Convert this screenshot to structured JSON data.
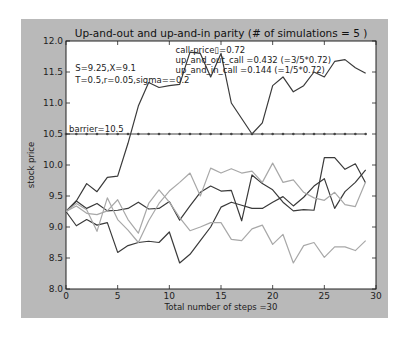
{
  "chart_data": {
    "type": "line",
    "title": "Up-and-out and up-and-in parity (# of simulations = 5 )",
    "xlabel": "Total number of steps =30",
    "ylabel": "stock price",
    "xlim": [
      0,
      30
    ],
    "ylim": [
      8.0,
      12.0
    ],
    "xticks": [
      "0",
      "5",
      "10",
      "15",
      "20",
      "25",
      "30"
    ],
    "yticks": [
      "8.0",
      "8.5",
      "9.0",
      "9.5",
      "10.0",
      "10.5",
      "11.0",
      "11.5",
      "12.0"
    ],
    "grid": false,
    "legend": null,
    "barrier": {
      "value": 10.5,
      "label": "barrier=10.5",
      "style": "dotted-marker line"
    },
    "annotations": {
      "params_line1": "S=9.25,X=9.1",
      "params_line2": "T=0.5,r=0.05,sigma==0.2",
      "call_price": "call-price▯=0.72",
      "up_and_out": "up_and_out_call =0.432 (=3/5*0.72)",
      "up_and_in": "up_and_in_call =0.144 (=1/5*0.72)"
    },
    "x": [
      0,
      1,
      2,
      3,
      4,
      5,
      6,
      7,
      8,
      9,
      10,
      11,
      12,
      13,
      14,
      15,
      16,
      17,
      18,
      19,
      20,
      21,
      22,
      23,
      24,
      25,
      26,
      27,
      28,
      29
    ],
    "series": [
      {
        "name": "path-1",
        "color": "#3a3a3a",
        "values": [
          9.25,
          9.42,
          9.7,
          9.57,
          9.8,
          9.82,
          10.35,
          10.95,
          11.33,
          11.25,
          11.28,
          11.3,
          11.82,
          11.8,
          11.42,
          11.8,
          11.0,
          10.75,
          10.5,
          10.68,
          11.28,
          11.42,
          11.18,
          11.28,
          11.5,
          11.42,
          11.67,
          11.7,
          11.57,
          11.48
        ]
      },
      {
        "name": "path-2",
        "color": "#3a3a3a",
        "values": [
          9.25,
          9.02,
          9.12,
          9.03,
          9.07,
          8.59,
          8.7,
          8.75,
          8.77,
          8.75,
          8.92,
          8.42,
          8.56,
          8.78,
          9.0,
          9.32,
          9.4,
          9.35,
          9.3,
          9.3,
          9.4,
          9.49,
          9.34,
          9.48,
          9.66,
          9.78,
          9.3,
          9.57,
          9.72,
          9.92
        ]
      },
      {
        "name": "path-3",
        "color": "#3a3a3a",
        "values": [
          9.25,
          9.42,
          9.3,
          9.38,
          9.26,
          9.27,
          9.3,
          9.4,
          9.29,
          9.3,
          9.41,
          9.11,
          9.34,
          9.56,
          9.66,
          9.58,
          9.59,
          9.1,
          9.84,
          9.7,
          9.6,
          9.4,
          9.26,
          9.28,
          9.27,
          10.12,
          10.12,
          9.93,
          10.02,
          9.71
        ]
      },
      {
        "name": "path-4",
        "color": "#a8a8a8",
        "values": [
          9.25,
          9.38,
          9.28,
          8.93,
          9.47,
          9.12,
          8.95,
          8.75,
          9.1,
          9.38,
          9.58,
          9.72,
          9.87,
          9.5,
          9.95,
          9.87,
          9.94,
          9.87,
          9.9,
          9.72,
          10.03,
          9.72,
          9.76,
          9.56,
          9.47,
          9.43,
          9.56,
          9.36,
          9.33,
          9.73
        ]
      },
      {
        "name": "path-5",
        "color": "#a8a8a8",
        "values": [
          9.25,
          9.34,
          9.22,
          9.2,
          9.26,
          9.44,
          9.12,
          8.9,
          9.38,
          9.6,
          9.4,
          9.15,
          8.94,
          9.0,
          9.07,
          9.07,
          8.8,
          8.78,
          8.97,
          9.03,
          8.72,
          8.88,
          8.42,
          8.7,
          8.75,
          8.51,
          8.68,
          8.68,
          8.62,
          8.78
        ]
      }
    ]
  }
}
